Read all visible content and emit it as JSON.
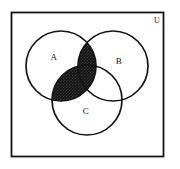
{
  "figure": {
    "universe_label": "U",
    "background_color": "#ffffff",
    "stroke_color": "#141414",
    "shade_color": "#1a1a1a",
    "shade_pattern": "dense-stipple"
  },
  "sets": [
    {
      "id": "A",
      "label": "A",
      "label_x": 54,
      "label_y": 60,
      "cx": 61,
      "cy": 66,
      "r": 35
    },
    {
      "id": "B",
      "label": "B",
      "label_x": 119,
      "label_y": 64,
      "cx": 113,
      "cy": 66,
      "r": 35
    },
    {
      "id": "C",
      "label": "C",
      "label_x": 86,
      "label_y": 114,
      "cx": 87,
      "cy": 100,
      "r": 35
    }
  ],
  "universe": {
    "label": "U",
    "label_x": 157,
    "label_y": 22,
    "x": 11,
    "y": 12,
    "width": 153,
    "height": 145
  },
  "shaded_region": {
    "expression": "A ∩ (B ∪ C)",
    "description": "Intersection of A with the union of B and C",
    "includes": [
      "A∩B",
      "A∩C",
      "A∩B∩C"
    ],
    "excludes": [
      "A only",
      "B only",
      "C only",
      "B∩C only",
      "outside"
    ]
  }
}
